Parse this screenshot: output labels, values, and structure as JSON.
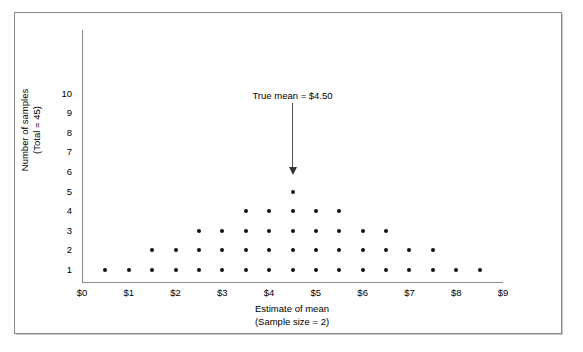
{
  "chart_data": {
    "type": "scatter",
    "plot_style": "dot-plot",
    "title": "",
    "xlabel": "Estimate of mean",
    "xlabel_sub": "(Sample size = 2)",
    "ylabel": "Number of samples",
    "ylabel_sub": "(Total = 45)",
    "xlim": [
      0,
      9
    ],
    "ylim": [
      0,
      10.5
    ],
    "x_ticks": [
      "$0",
      "$1",
      "$2",
      "$3",
      "$4",
      "$5",
      "$6",
      "$7",
      "$8",
      "$9"
    ],
    "x_tick_values": [
      0,
      1,
      2,
      3,
      4,
      5,
      6,
      7,
      8,
      9
    ],
    "y_ticks": [
      "1",
      "2",
      "3",
      "4",
      "5",
      "6",
      "7",
      "8",
      "9",
      "10"
    ],
    "y_tick_values": [
      1,
      2,
      3,
      4,
      5,
      6,
      7,
      8,
      9,
      10
    ],
    "grid": false,
    "legend": false,
    "bin_width": 0.5,
    "total_samples": 45,
    "categories": [
      0.5,
      1.0,
      1.5,
      2.0,
      2.5,
      3.0,
      3.5,
      4.0,
      4.5,
      5.0,
      5.5,
      6.0,
      6.5,
      7.0,
      7.5,
      8.0,
      8.5
    ],
    "values": [
      1,
      1,
      2,
      2,
      3,
      3,
      4,
      4,
      5,
      4,
      4,
      3,
      3,
      2,
      2,
      1,
      1
    ],
    "points": [
      {
        "x": 0.5,
        "count": 1
      },
      {
        "x": 1.0,
        "count": 1
      },
      {
        "x": 1.5,
        "count": 2
      },
      {
        "x": 2.0,
        "count": 2
      },
      {
        "x": 2.5,
        "count": 3
      },
      {
        "x": 3.0,
        "count": 3
      },
      {
        "x": 3.5,
        "count": 4
      },
      {
        "x": 4.0,
        "count": 4
      },
      {
        "x": 4.5,
        "count": 5
      },
      {
        "x": 5.0,
        "count": 4
      },
      {
        "x": 5.5,
        "count": 4
      },
      {
        "x": 6.0,
        "count": 3
      },
      {
        "x": 6.5,
        "count": 3
      },
      {
        "x": 7.0,
        "count": 2
      },
      {
        "x": 7.5,
        "count": 2
      },
      {
        "x": 8.0,
        "count": 1
      },
      {
        "x": 8.5,
        "count": 1
      }
    ],
    "row_counts": {
      "1": 17,
      "2": 13,
      "3": 9,
      "4": 5,
      "5": 1
    },
    "annotations": [
      {
        "name": "true-mean",
        "text": "True mean  =  $4.50",
        "x": 4.5,
        "arrow": "down"
      }
    ],
    "colors": {
      "dot": "#111111",
      "axis": "#8a8a8a",
      "frame": "#8a8a8a",
      "arrow": "#333333",
      "background": "#ffffff"
    }
  }
}
